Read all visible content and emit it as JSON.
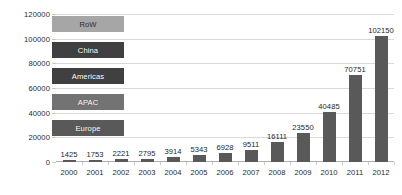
{
  "chart_data": {
    "type": "bar",
    "title": "",
    "xlabel": "",
    "ylabel": "",
    "categories": [
      "2000",
      "2001",
      "2002",
      "2003",
      "2004",
      "2005",
      "2006",
      "2007",
      "2008",
      "2009",
      "2010",
      "2011",
      "2012"
    ],
    "values": [
      1425,
      1753,
      2221,
      2795,
      3914,
      5343,
      6928,
      9511,
      16111,
      23550,
      40485,
      70751,
      102150
    ],
    "value_labels": [
      "1425",
      "1753",
      "2221",
      "2795",
      "3914",
      "5343",
      "6928",
      "9511",
      "16111",
      "23550",
      "40485",
      "70751",
      "102150"
    ],
    "ylim": [
      0,
      120000
    ],
    "yticks": [
      0,
      20000,
      40000,
      60000,
      80000,
      100000,
      120000
    ],
    "ytick_labels": [
      "0",
      "20000",
      "40000",
      "60000",
      "80000",
      "100000",
      "120000"
    ],
    "grid": true,
    "legend_position": "inside-upper-left",
    "series": [
      {
        "name": "RoW",
        "color": "#a6a6a6"
      },
      {
        "name": "China",
        "color": "#404040"
      },
      {
        "name": "Americas",
        "color": "#404040"
      },
      {
        "name": "APAC",
        "color": "#737373"
      },
      {
        "name": "Europe",
        "color": "#595959"
      }
    ],
    "bar_color": "#595959",
    "grid_color": "#d9d9d9",
    "background": "#ffffff"
  },
  "legend": {
    "items": [
      {
        "label": "RoW"
      },
      {
        "label": "China"
      },
      {
        "label": "Americas"
      },
      {
        "label": "APAC"
      },
      {
        "label": "Europe"
      }
    ]
  },
  "caption": {
    "text": ""
  }
}
